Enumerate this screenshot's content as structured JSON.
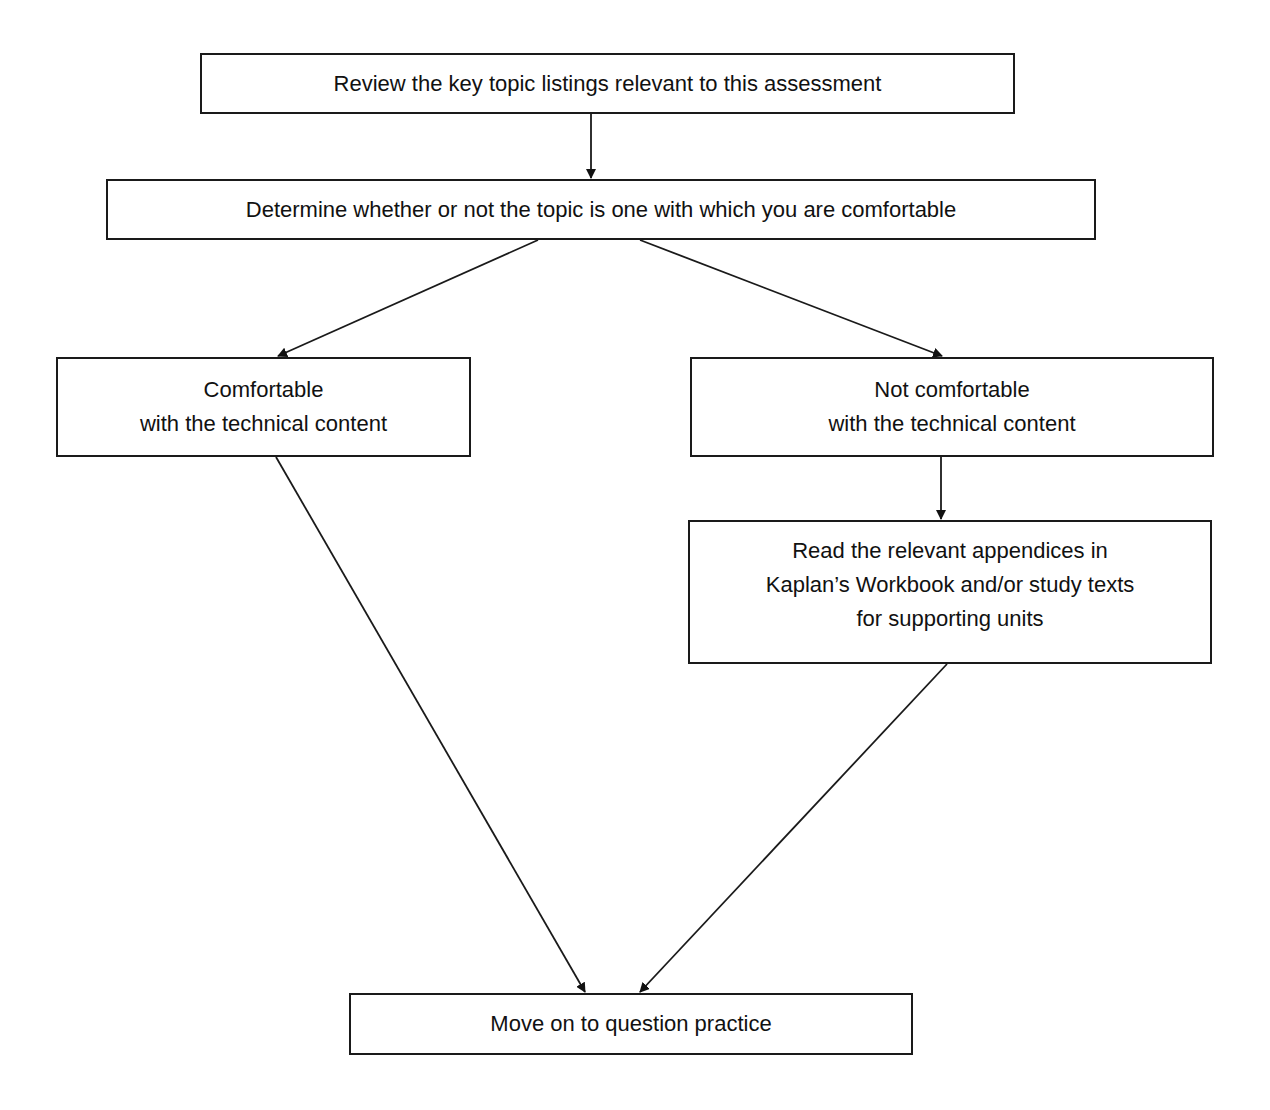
{
  "diagram": {
    "type": "flowchart",
    "nodes": [
      {
        "id": "review",
        "lines": [
          "Review the key topic listings relevant to this assessment"
        ]
      },
      {
        "id": "determine",
        "lines": [
          "Determine whether or not the topic is one with which you are comfortable"
        ]
      },
      {
        "id": "comfortable",
        "lines": [
          "Comfortable",
          "with the technical content"
        ]
      },
      {
        "id": "not_comfortable",
        "lines": [
          "Not comfortable",
          "with the technical content"
        ]
      },
      {
        "id": "read",
        "lines": [
          "Read the relevant appendices in",
          "Kaplan’s Workbook and/or study texts",
          "for supporting units"
        ]
      },
      {
        "id": "practice",
        "lines": [
          "Move on to question practice"
        ]
      }
    ],
    "edges": [
      {
        "from": "review",
        "to": "determine"
      },
      {
        "from": "determine",
        "to": "comfortable"
      },
      {
        "from": "determine",
        "to": "not_comfortable"
      },
      {
        "from": "not_comfortable",
        "to": "read"
      },
      {
        "from": "comfortable",
        "to": "practice"
      },
      {
        "from": "read",
        "to": "practice"
      }
    ],
    "colors": {
      "stroke": "#1a1a1a",
      "fill": "#ffffff",
      "text": "#111111"
    }
  }
}
